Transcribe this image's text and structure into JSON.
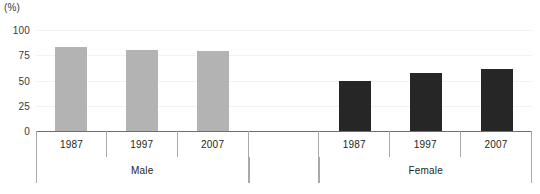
{
  "chart_data": {
    "type": "bar",
    "title": "",
    "subtitle": "",
    "unit_label": "(%)",
    "xlabel": "",
    "ylabel": "",
    "ylim": [
      0,
      100
    ],
    "yticks": [
      0,
      25,
      50,
      75,
      100
    ],
    "ytick_labels": [
      "0",
      "25",
      "50",
      "75",
      "100"
    ],
    "grid": true,
    "legend": "none",
    "groups": [
      "Male",
      "Female"
    ],
    "categories": [
      "1987",
      "1997",
      "2007"
    ],
    "series": [
      {
        "name": "Male",
        "color": "#b3b3b3",
        "categories": [
          "1987",
          "1997",
          "2007"
        ],
        "values": [
          83,
          80,
          79
        ]
      },
      {
        "name": "Female",
        "color": "#262626",
        "categories": [
          "1987",
          "1997",
          "2007"
        ],
        "values": [
          50,
          57,
          61
        ]
      }
    ],
    "bars": [
      {
        "group": "Male",
        "category": "1987",
        "value": 83,
        "color": "#b3b3b3"
      },
      {
        "group": "Male",
        "category": "1997",
        "value": 80,
        "color": "#b3b3b3"
      },
      {
        "group": "Male",
        "category": "2007",
        "value": 79,
        "color": "#b3b3b3"
      },
      {
        "group": "Female",
        "category": "1987",
        "value": 50,
        "color": "#262626"
      },
      {
        "group": "Female",
        "category": "1997",
        "value": 57,
        "color": "#262626"
      },
      {
        "group": "Female",
        "category": "2007",
        "value": 61,
        "color": "#262626"
      }
    ],
    "axis_cells": [
      {
        "label": "1987",
        "group": "Male",
        "blank": false
      },
      {
        "label": "1997",
        "group": "Male",
        "blank": false
      },
      {
        "label": "2007",
        "group": "Male",
        "blank": false
      },
      {
        "label": "",
        "group": "",
        "blank": true
      },
      {
        "label": "1987",
        "group": "Female",
        "blank": false
      },
      {
        "label": "1997",
        "group": "Female",
        "blank": false
      },
      {
        "label": "2007",
        "group": "Female",
        "blank": false
      }
    ],
    "group_cells": [
      {
        "label": "Male"
      },
      {
        "label": ""
      },
      {
        "label": "Female"
      }
    ]
  },
  "colors": {
    "male_bar": "#b3b3b3",
    "female_bar": "#262626",
    "axis_line": "#6d6e71",
    "grid_line": "#f2f2f2",
    "table_border": "#a7a9ac",
    "text": "#231f20",
    "background": "#ffffff"
  }
}
